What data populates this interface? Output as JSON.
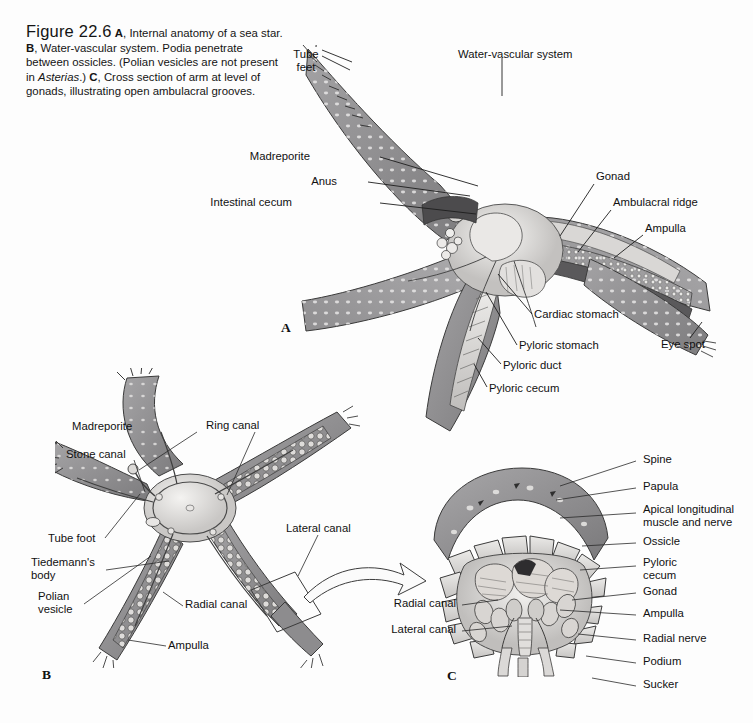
{
  "figure": {
    "number": "Figure 22.6",
    "caption_parts": [
      {
        "text": "A",
        "style": "bold"
      },
      {
        "text": ", Internal anatomy of a sea star. ",
        "style": "normal"
      },
      {
        "text": "B",
        "style": "bold"
      },
      {
        "text": ", Water-vascular system. Podia penetrate between ossicles. (Polian vesicles are not present in ",
        "style": "normal"
      },
      {
        "text": "Asterias",
        "style": "italic"
      },
      {
        "text": ".) ",
        "style": "normal"
      },
      {
        "text": "C",
        "style": "bold"
      },
      {
        "text": ", Cross section of arm at level of gonads, illustrating open ambulacral grooves.",
        "style": "normal"
      }
    ],
    "caption_plain": "Figure 22.6 A, Internal anatomy of a sea star. B, Water-vascular system. Podia penetrate between ossicles. (Polian vesicles are not present in Asterias.) C, Cross section of arm at level of gonads, illustrating open ambulacral grooves."
  },
  "panels": [
    {
      "id": "A",
      "letter": "A",
      "title": "Internal anatomy of a sea star",
      "labels": [
        {
          "name": "tube-feet",
          "text": "Tube\nfeet",
          "x": 286,
          "y": 48,
          "align": "left"
        },
        {
          "name": "water-vascular-system",
          "text": "Water-vascular system",
          "x": 458,
          "y": 48,
          "align": "left"
        },
        {
          "name": "madreporite",
          "text": "Madreporite",
          "x": 310,
          "y": 156,
          "align": "right"
        },
        {
          "name": "anus",
          "text": "Anus",
          "x": 337,
          "y": 181,
          "align": "right"
        },
        {
          "name": "intestinal-cecum",
          "text": "Intestinal cecum",
          "x": 292,
          "y": 201,
          "align": "right"
        },
        {
          "name": "gonad",
          "text": "Gonad",
          "x": 596,
          "y": 176,
          "align": "left"
        },
        {
          "name": "ambulacral-ridge",
          "text": "Ambulacral ridge",
          "x": 613,
          "y": 202,
          "align": "left"
        },
        {
          "name": "ampulla",
          "text": "Ampulla",
          "x": 645,
          "y": 228,
          "align": "left"
        },
        {
          "name": "cardiac-stomach",
          "text": "Cardiac stomach",
          "x": 534,
          "y": 314,
          "align": "left"
        },
        {
          "name": "pyloric-stomach",
          "text": "Pyloric stomach",
          "x": 519,
          "y": 345,
          "align": "left"
        },
        {
          "name": "pyloric-duct",
          "text": "Pyloric duct",
          "x": 503,
          "y": 365,
          "align": "left"
        },
        {
          "name": "pyloric-cecum",
          "text": "Pyloric cecum",
          "x": 489,
          "y": 388,
          "align": "left"
        },
        {
          "name": "eye-spot",
          "text": "Eye spot",
          "x": 661,
          "y": 344,
          "align": "left"
        }
      ]
    },
    {
      "id": "B",
      "letter": "B",
      "title": "Water-vascular system",
      "labels": [
        {
          "name": "madreporite",
          "text": "Madreporite",
          "x": 147,
          "y": 426,
          "align": "left"
        },
        {
          "name": "ring-canal",
          "text": "Ring canal",
          "x": 206,
          "y": 425,
          "align": "left"
        },
        {
          "name": "stone-canal",
          "text": "Stone canal",
          "x": 72,
          "y": 454,
          "align": "left"
        },
        {
          "name": "tube-foot",
          "text": "Tube foot",
          "x": 55,
          "y": 542,
          "align": "left"
        },
        {
          "name": "tiedemanns-body",
          "text": "Tiedemann's\nbody",
          "x": 36,
          "y": 567,
          "align": "left"
        },
        {
          "name": "polian-vesicle",
          "text": "Polian\nvesicle",
          "x": 42,
          "y": 601,
          "align": "left"
        },
        {
          "name": "radial-canal",
          "text": "Radial canal",
          "x": 185,
          "y": 603,
          "align": "left"
        },
        {
          "name": "ampulla",
          "text": "Ampulla",
          "x": 168,
          "y": 643,
          "align": "left"
        },
        {
          "name": "lateral-canal",
          "text": "Lateral canal",
          "x": 286,
          "y": 528,
          "align": "left"
        }
      ]
    },
    {
      "id": "C",
      "letter": "C",
      "title": "Cross section of arm at level of gonads",
      "labels": [
        {
          "name": "spine",
          "text": "Spine",
          "x": 640,
          "y": 458,
          "align": "left"
        },
        {
          "name": "papula",
          "text": "Papula",
          "x": 640,
          "y": 485,
          "align": "left"
        },
        {
          "name": "apical-longitudinal-muscle-and-nerve",
          "text": "Apical longitudinal\nmuscle and nerve",
          "x": 640,
          "y": 508,
          "align": "left"
        },
        {
          "name": "ossicle",
          "text": "Ossicle",
          "x": 640,
          "y": 540,
          "align": "left"
        },
        {
          "name": "pyloric-cecum",
          "text": "Pyloric\ncecum",
          "x": 640,
          "y": 561,
          "align": "left"
        },
        {
          "name": "gonad",
          "text": "Gonad",
          "x": 640,
          "y": 590,
          "align": "left"
        },
        {
          "name": "ampulla",
          "text": "Ampulla",
          "x": 640,
          "y": 612,
          "align": "left"
        },
        {
          "name": "radial-nerve",
          "text": "Radial nerve",
          "x": 640,
          "y": 637,
          "align": "left"
        },
        {
          "name": "podium",
          "text": "Podium",
          "x": 640,
          "y": 660,
          "align": "left"
        },
        {
          "name": "sucker",
          "text": "Sucker",
          "x": 640,
          "y": 683,
          "align": "left"
        },
        {
          "name": "radial-canal",
          "text": "Radial canal",
          "x": 456,
          "y": 602,
          "align": "right"
        },
        {
          "name": "lateral-canal",
          "text": "Lateral canal",
          "x": 456,
          "y": 628,
          "align": "right"
        }
      ]
    }
  ],
  "colors": {
    "background": "#fdfdfd",
    "text": "#111111",
    "leader_line": "#1d1d1d",
    "body_wall_dark": "#7f7e80",
    "body_wall_mid": "#9a999b",
    "body_wall_light": "#b9b8ba",
    "organ_light": "#e4e2e0",
    "organ_mid": "#c8c6c4",
    "organ_shadow": "#8d8b8a",
    "cavity_dark": "#4a4a4c",
    "outline": "#2b2b2b"
  }
}
